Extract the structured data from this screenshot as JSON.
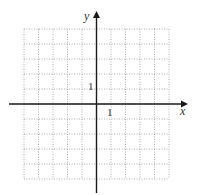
{
  "chart_data": {
    "type": "coordinate-grid",
    "title": "",
    "xlabel": "x",
    "ylabel": "y",
    "xlim": [
      -5,
      5
    ],
    "ylim": [
      -5,
      5
    ],
    "grid": true,
    "grid_style": "dotted",
    "x_tick_labels": [
      {
        "value": 1,
        "label": "1"
      }
    ],
    "y_tick_labels": [
      {
        "value": 1,
        "label": "1"
      }
    ],
    "series": []
  },
  "axes": {
    "x_label": "x",
    "y_label": "y",
    "x_unit_label": "1",
    "y_unit_label": "1"
  },
  "colors": {
    "axis": "#1a1a1a",
    "grid": "#9a9a9a",
    "text": "#333333"
  }
}
